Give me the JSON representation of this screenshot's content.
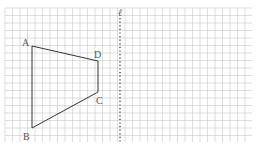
{
  "figure": {
    "type": "grid-geometry",
    "grid": {
      "x0": 5,
      "y0": 8,
      "x1": 252,
      "y1": 142,
      "cell": 7.5,
      "color": "#c8c8c8"
    },
    "quadrilateral": {
      "name": "ABCD",
      "stroke": "#333333",
      "vertices": [
        {
          "label": "A",
          "x": 32,
          "y": 46,
          "lx": 22,
          "ly": 46
        },
        {
          "label": "D",
          "x": 98,
          "y": 61,
          "lx": 94,
          "ly": 58
        },
        {
          "label": "C",
          "x": 98,
          "y": 92,
          "lx": 96,
          "ly": 104
        },
        {
          "label": "B",
          "x": 32,
          "y": 128,
          "lx": 23,
          "ly": 140
        }
      ]
    },
    "axis_line": {
      "label": "ℓ",
      "x": 120,
      "y_top": 10,
      "y_bottom": 142,
      "style": "dotted",
      "color": "#444444"
    }
  }
}
